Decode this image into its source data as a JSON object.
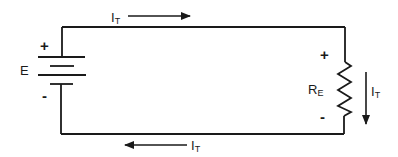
{
  "diagram": {
    "type": "series circuit",
    "colors": {
      "line": "#1a1a1a",
      "background": "#ffffff"
    },
    "source": {
      "label": "E",
      "polarity_plus": "+",
      "polarity_minus": "-"
    },
    "load": {
      "label_main": "R",
      "label_sub": "E",
      "polarity_plus": "+",
      "polarity_minus": "-"
    },
    "currents": [
      {
        "id": "top",
        "label_main": "I",
        "label_sub": "T",
        "direction": "right"
      },
      {
        "id": "right",
        "label_main": "I",
        "label_sub": "T",
        "direction": "down"
      },
      {
        "id": "bottom",
        "label_main": "I",
        "label_sub": "T",
        "direction": "left"
      }
    ]
  }
}
